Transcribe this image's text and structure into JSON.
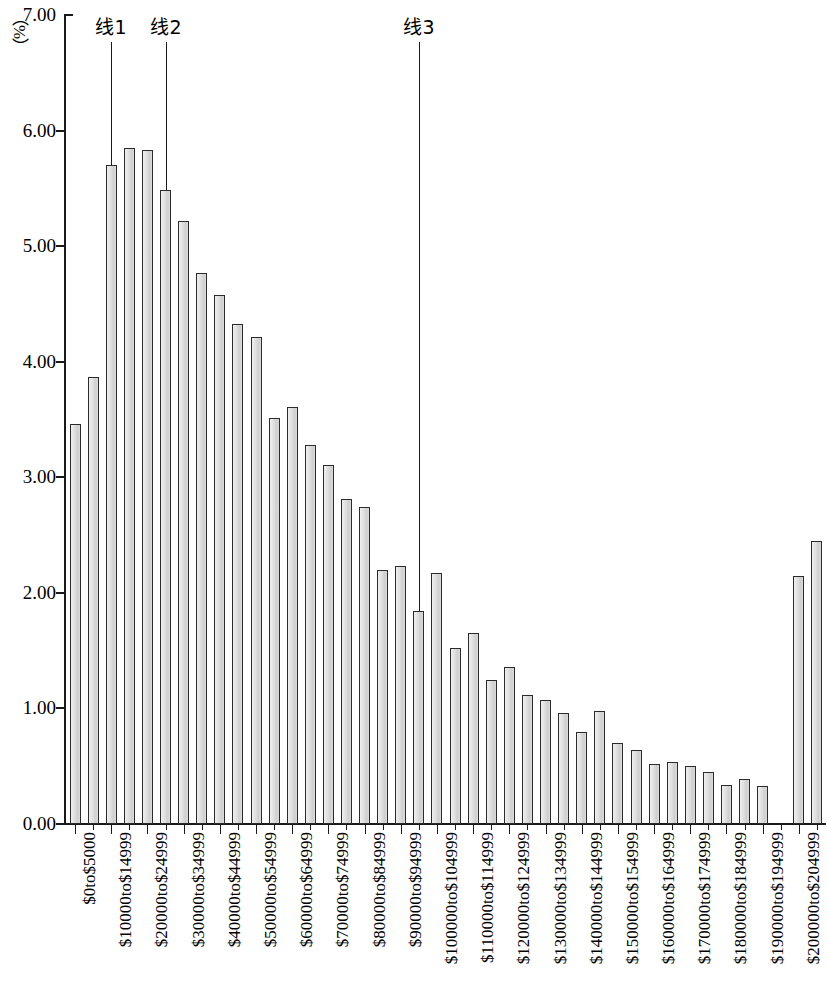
{
  "chart_data": {
    "type": "bar",
    "title": "",
    "subtitle": "",
    "xlabel": "",
    "ylabel": "（%）",
    "ylim": [
      0,
      7
    ],
    "ytick_labels": [
      "0.00",
      "1.00",
      "2.00",
      "3.00",
      "4.00",
      "5.00",
      "6.00",
      "7.00"
    ],
    "ytick_values": [
      0,
      1,
      2,
      3,
      4,
      5,
      6,
      7
    ],
    "grid": false,
    "legend": "none",
    "label_every_n_categories": 2,
    "categories": [
      "$0to$5000",
      "$5000to$9999",
      "$10000to$14999",
      "$15000to$19999",
      "$20000to$24999",
      "$25000to$29999",
      "$30000to$34999",
      "$35000to$39999",
      "$40000to$44999",
      "$45000to$49999",
      "$50000to$54999",
      "$55000to$59999",
      "$60000to$64999",
      "$65000to$69999",
      "$70000to$74999",
      "$75000to$79999",
      "$80000to$84999",
      "$85000to$89999",
      "$90000to$94999",
      "$95000to$99999",
      "$100000to$104999",
      "$105000to$109999",
      "$110000to$114999",
      "$115000to$119999",
      "$120000to$124999",
      "$125000to$129999",
      "$130000to$134999",
      "$135000to$139999",
      "$140000to$144999",
      "$145000to$149999",
      "$150000to$154999",
      "$155000to$159999",
      "$160000to$164999",
      "$165000to$169999",
      "$170000to$174999",
      "$175000to$179999",
      "$180000to$184999",
      "$185000to$189999",
      "$190000to$194999",
      "$195000to$199999",
      "$200000to$204999",
      "$205000andover"
    ],
    "displayed_tick_labels": [
      "$0to$5000",
      "$10000to$14999",
      "$20000to$24999",
      "$30000to$34999",
      "$40000to$44999",
      "$50000to$54999",
      "$60000to$64999",
      "$70000to$74999",
      "$80000to$84999",
      "$90000to$94999",
      "$100000to$104999",
      "$110000to$114999",
      "$120000to$124999",
      "$130000to$134999",
      "$140000to$144999",
      "$150000to$154999",
      "$160000to$164999",
      "$170000to$174999",
      "$180000to$184999",
      "$190000to$194999",
      "$200000to$204999"
    ],
    "values": [
      3.46,
      3.87,
      5.7,
      5.85,
      5.83,
      5.49,
      5.22,
      4.77,
      4.58,
      4.33,
      4.21,
      3.51,
      3.61,
      3.28,
      3.11,
      2.81,
      2.74,
      2.2,
      2.23,
      1.84,
      2.17,
      1.52,
      1.65,
      1.25,
      1.36,
      1.12,
      1.07,
      0.96,
      0.8,
      0.98,
      0.7,
      0.64,
      0.52,
      0.54,
      0.5,
      0.45,
      0.34,
      0.39,
      0.33,
      0.0,
      2.15,
      2.45
    ],
    "annotations": [
      {
        "label": "线1",
        "category_index": 2,
        "value_at_line_end": 5.7
      },
      {
        "label": "线2",
        "category_index": 5,
        "value_at_line_end": 5.49
      },
      {
        "label": "线3",
        "category_index": 19,
        "value_at_line_end": 1.84
      }
    ],
    "colors": {
      "bar_fill": "#dcdcdc",
      "bar_stroke": "#2b2b2b",
      "axis": "#1a1a1a",
      "text": "#000000",
      "annotation_line": "#1a1a1a"
    }
  }
}
